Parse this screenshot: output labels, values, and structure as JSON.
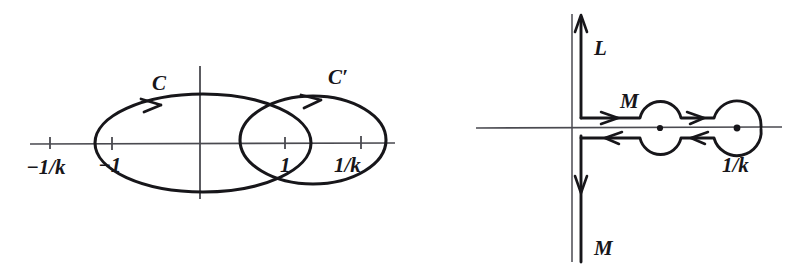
{
  "figure": {
    "background_color": "#ffffff",
    "ink_color": "#17161a",
    "axis_color": "#4a4a50",
    "panels": [
      {
        "id": "left-panel",
        "name": "two-overlapping-ellipse-contours",
        "description": "Real axis with two overlapping elliptical contours C and C' oriented counterclockwise",
        "axes": {
          "real_axis": true,
          "imaginary_axis": true
        },
        "tick_labels": [
          {
            "id": "tick-minus-one-over-k",
            "text": "−1/k",
            "x": 50,
            "y": 144
          },
          {
            "id": "tick-minus-one",
            "text": "−1",
            "x": 110,
            "y": 144
          },
          {
            "id": "tick-one",
            "text": "1",
            "x": 285,
            "y": 144
          },
          {
            "id": "tick-one-over-k",
            "text": "1/k",
            "x": 350,
            "y": 144
          }
        ],
        "contours": [
          {
            "id": "contour-C",
            "label": "C",
            "direction": "counterclockwise",
            "label_x": 152,
            "label_y": 88
          },
          {
            "id": "contour-C-prime",
            "label": "C′",
            "direction": "counterclockwise",
            "label_x": 330,
            "label_y": 82
          }
        ]
      },
      {
        "id": "right-panel",
        "name": "keyhole-contour-with-branch-cut",
        "description": "Vertical line L going up, M going down, and a two-sided horizontal contour M hugging the branch cut around poles at 1 and 1/k",
        "axes": {
          "real_axis": true,
          "imaginary_axis": true
        },
        "tick_labels": [
          {
            "id": "tick-one-over-k-right",
            "text": "1/k",
            "x": 730,
            "y": 155
          }
        ],
        "contours": [
          {
            "id": "contour-L",
            "label": "L",
            "direction": "upward",
            "label_x": 597,
            "label_y": 47
          },
          {
            "id": "contour-M-horizontal",
            "label": "M",
            "direction": "rightward-out-leftward-back",
            "label_x": 628,
            "label_y": 105
          },
          {
            "id": "contour-M-lower",
            "label": "M",
            "direction": "downward",
            "label_x": 597,
            "label_y": 247
          }
        ],
        "poles": [
          {
            "id": "pole-one",
            "x": 660,
            "y": 128
          },
          {
            "id": "pole-one-over-k",
            "x": 737,
            "y": 128
          }
        ]
      }
    ]
  }
}
